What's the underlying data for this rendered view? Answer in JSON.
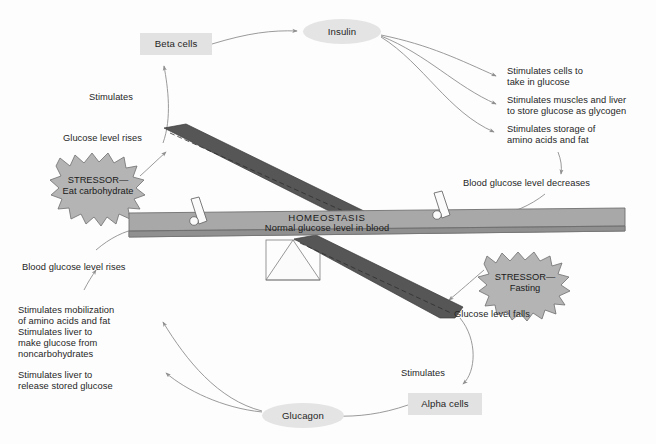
{
  "diagram": {
    "colors": {
      "page_background": "#fdfdfd",
      "node_fill": "#e2e2e2",
      "hormone_fill": "#e4e4e4",
      "beam_face": "#a8a8a8",
      "beam_edge": "#8d8d8d",
      "pointer_fill": "#555555",
      "starburst_fill": "#b4b4b4",
      "arrow_stroke": "#8a8a8a",
      "text": "#262626"
    }
  },
  "nodes": {
    "beta_cells": {
      "label": "Beta cells"
    },
    "alpha_cells": {
      "label": "Alpha cells"
    },
    "insulin": {
      "label": "Insulin"
    },
    "glucagon": {
      "label": "Glucagon"
    }
  },
  "beam": {
    "title": "HOMEOSTASIS",
    "subtitle": "Normal glucose level in blood"
  },
  "stressors": {
    "carbohydrate": {
      "line1": "STRESSOR—",
      "line2": "Eat carbohydrate"
    },
    "fasting": {
      "line1": "STRESSOR—",
      "line2": "Fasting"
    }
  },
  "labels": {
    "glucose_level_rises": "Glucose level rises",
    "glucose_level_falls": "Glucose level falls",
    "stimulates_beta": "Stimulates",
    "stimulates_alpha": "Stimulates",
    "blood_glucose_decreases": "Blood glucose level decreases",
    "blood_glucose_rises": "Blood glucose level rises"
  },
  "insulin_effects": [
    {
      "line1": "Stimulates cells to",
      "line2": "take in glucose"
    },
    {
      "line1": "Stimulates muscles and liver",
      "line2": "to store glucose as glycogen"
    },
    {
      "line1": "Stimulates storage of",
      "line2": "amino acids and fat"
    }
  ],
  "glucagon_effects": [
    {
      "line1": "Stimulates mobilization",
      "line2": "of amino acids and fat",
      "line3": "Stimulates liver to",
      "line4": "make glucose from",
      "line5": "noncarbohydrates"
    },
    {
      "line1": "Stimulates liver to",
      "line2": "release stored glucose"
    }
  ]
}
